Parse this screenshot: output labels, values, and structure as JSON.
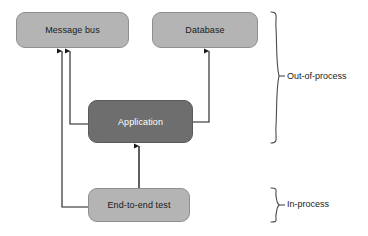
{
  "diagram": {
    "canvas": {
      "width": 368,
      "height": 236,
      "background": "#ffffff"
    },
    "colors": {
      "node_light_fill": "#b4b4b4",
      "node_dark_fill": "#6e6e6e",
      "node_stroke": "#8f8f8f",
      "arrow_stroke": "#1a1a1a",
      "brace_stroke": "#4a4a4a",
      "text_dark": "#1a1a1a",
      "text_light": "#ffffff"
    },
    "nodes": [
      {
        "id": "message-bus",
        "label": "Message bus",
        "style": "light",
        "x": 16,
        "y": 12,
        "w": 113,
        "h": 36
      },
      {
        "id": "database",
        "label": "Database",
        "style": "light",
        "x": 152,
        "y": 12,
        "w": 106,
        "h": 36
      },
      {
        "id": "application",
        "label": "Application",
        "style": "dark",
        "x": 88,
        "y": 100,
        "w": 105,
        "h": 43
      },
      {
        "id": "end-to-end-test",
        "label": "End-to-end test",
        "style": "light",
        "x": 88,
        "y": 188,
        "w": 102,
        "h": 34
      }
    ],
    "edges": [
      {
        "id": "application-to-message-bus",
        "from": "application",
        "to": "message-bus",
        "points": "88,124 70,124 70,50",
        "arrowhead_at": "70,48"
      },
      {
        "id": "end-to-end-test-to-message-bus",
        "from": "end-to-end-test",
        "to": "message-bus",
        "points": "88,207 62,207 62,50",
        "arrowhead_at": "62,48"
      },
      {
        "id": "application-to-database",
        "from": "application",
        "to": "database",
        "points": "193,122 209,122 209,50",
        "arrowhead_at": "209,48"
      },
      {
        "id": "end-to-end-test-to-application",
        "from": "end-to-end-test",
        "to": "application",
        "points": "139,188 139,145",
        "arrowhead_at": "139,143"
      }
    ],
    "groups": [
      {
        "id": "out-of-process",
        "label": "Out-of-process",
        "brace_top": 12,
        "brace_bottom": 143,
        "label_x": 287,
        "label_y": 77
      },
      {
        "id": "in-process",
        "label": "In-process",
        "brace_top": 188,
        "brace_bottom": 222,
        "label_x": 287,
        "label_y": 205
      }
    ]
  }
}
